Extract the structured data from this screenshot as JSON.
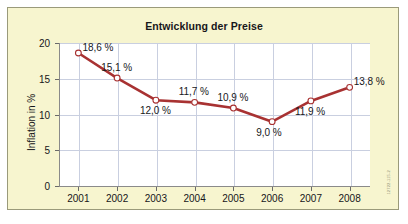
{
  "chart_data": {
    "type": "line",
    "title": "Entwicklung der Preise",
    "xlabel": "",
    "ylabel": "Inflation in %",
    "categories": [
      "2001",
      "2002",
      "2003",
      "2004",
      "2005",
      "2006",
      "2007",
      "2008"
    ],
    "values": [
      18.6,
      15.1,
      12.0,
      11.7,
      10.9,
      9.0,
      11.9,
      13.8
    ],
    "point_labels": [
      "18,6 %",
      "15,1 %",
      "12,0 %",
      "11,7 %",
      "10,9 %",
      "9,0 %",
      "11,9 %",
      "13,8 %"
    ],
    "label_positions": [
      "right",
      "above",
      "below",
      "above",
      "above",
      "below",
      "below",
      "right"
    ],
    "ylim": [
      0,
      20
    ],
    "yticks": [
      0,
      5,
      10,
      15,
      20
    ],
    "ytick_labels": [
      "0",
      "5",
      "10",
      "15",
      "20"
    ],
    "grid": true,
    "legend": false,
    "series_color": "#a83232",
    "marker_fill": "#ffffff",
    "panel_color": "#f7f5cf",
    "plot_color": "#ffffff",
    "grid_color": "#c9cfe0"
  },
  "footer": {
    "source_code": "12722-115-2"
  }
}
